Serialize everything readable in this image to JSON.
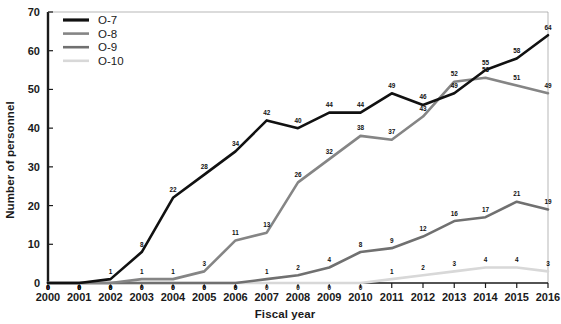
{
  "chart_data": {
    "type": "line",
    "title": "",
    "xlabel": "Fiscal year",
    "ylabel": "Number of personnel",
    "categories": [
      2000,
      2001,
      2002,
      2003,
      2004,
      2005,
      2006,
      2007,
      2008,
      2009,
      2010,
      2011,
      2012,
      2013,
      2014,
      2015,
      2016
    ],
    "x": [
      "2000",
      "2001",
      "2002",
      "2003",
      "2004",
      "2005",
      "2006",
      "2007",
      "2008",
      "2009",
      "2010",
      "2011",
      "2012",
      "2013",
      "2014",
      "2015",
      "2016"
    ],
    "xlim": [
      2000,
      2016
    ],
    "ylim": [
      0,
      70
    ],
    "yticks": [
      0,
      10,
      20,
      30,
      40,
      50,
      60,
      70
    ],
    "ytick_labels": [
      "0",
      "10",
      "20",
      "30",
      "40",
      "50",
      "60",
      "70"
    ],
    "grid": false,
    "legend_position": "top-left",
    "series": [
      {
        "name": "O-7",
        "color": "#111111",
        "width": 2.6,
        "values": [
          0,
          0,
          1,
          8,
          22,
          28,
          34,
          42,
          40,
          44,
          44,
          49,
          46,
          49,
          55,
          58,
          64
        ],
        "labels": [
          "0",
          "0",
          "1",
          "8",
          "22",
          "28",
          "34",
          "42",
          "40",
          "44",
          "44",
          "49",
          "46",
          "49",
          "55",
          "58",
          "64"
        ]
      },
      {
        "name": "O-8",
        "color": "#858585",
        "width": 2.6,
        "values": [
          0,
          0,
          0,
          1,
          1,
          3,
          11,
          13,
          26,
          32,
          38,
          37,
          43,
          52,
          53,
          51,
          49
        ],
        "labels": [
          "0",
          "0",
          "0",
          "1",
          "1",
          "3",
          "11",
          "13",
          "26",
          "32",
          "38",
          "37",
          "43",
          "52",
          "53",
          "51",
          "49"
        ]
      },
      {
        "name": "O-9",
        "color": "#707070",
        "width": 2.6,
        "values": [
          0,
          0,
          0,
          0,
          0,
          0,
          0,
          1,
          2,
          4,
          8,
          9,
          12,
          16,
          17,
          21,
          19
        ],
        "labels": [
          "0",
          "0",
          "0",
          "0",
          "0",
          "0",
          "0",
          "1",
          "2",
          "4",
          "8",
          "9",
          "12",
          "16",
          "17",
          "21",
          "19"
        ]
      },
      {
        "name": "O-10",
        "color": "#d8d8d8",
        "width": 2.6,
        "values": [
          0,
          0,
          0,
          0,
          0,
          0,
          0,
          0,
          0,
          0,
          0,
          1,
          2,
          3,
          4,
          4,
          3
        ],
        "labels": [
          "0",
          "0",
          "0",
          "0",
          "0",
          "0",
          "0",
          "0",
          "0",
          "0",
          "0",
          "1",
          "2",
          "3",
          "4",
          "4",
          "3"
        ]
      }
    ],
    "legend": [
      {
        "label": "O-7",
        "color": "#111111",
        "width": 3.2
      },
      {
        "label": "O-8",
        "color": "#858585",
        "width": 2.6
      },
      {
        "label": "O-9",
        "color": "#707070",
        "width": 2.6
      },
      {
        "label": "O-10",
        "color": "#d8d8d8",
        "width": 2.6
      }
    ],
    "axis_color": "#1a1a1a",
    "background": "#ffffff"
  }
}
